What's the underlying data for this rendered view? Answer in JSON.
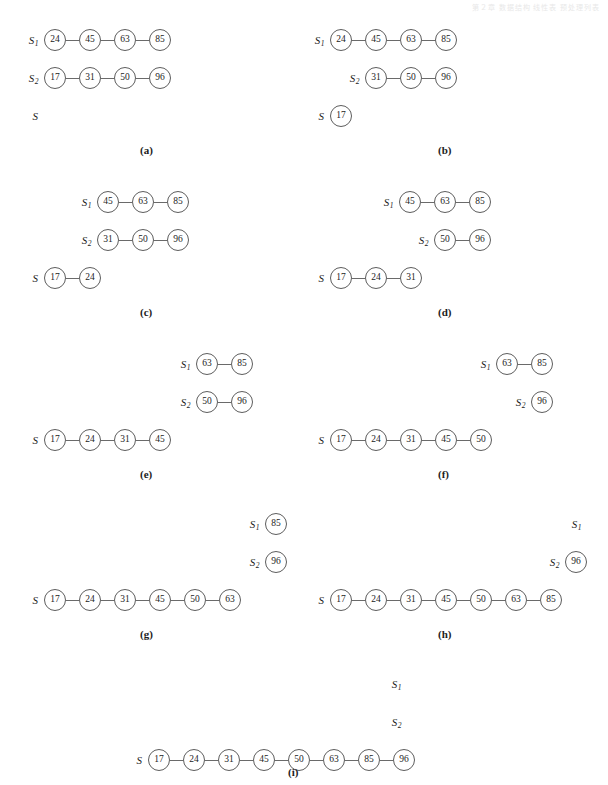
{
  "header": {
    "text": "第２章  数据结构  线性表  预处理列表"
  },
  "labels": {
    "s1": "S",
    "s1_sub": "1",
    "s2": "S",
    "s2_sub": "2",
    "s": "S"
  },
  "panels": [
    {
      "id": "a",
      "caption": "(a)",
      "rows": {
        "s1": [
          24,
          45,
          63,
          85
        ],
        "s2": [
          17,
          31,
          50,
          96
        ],
        "s": []
      }
    },
    {
      "id": "b",
      "caption": "(b)",
      "rows": {
        "s1": [
          24,
          45,
          63,
          85
        ],
        "s2": [
          31,
          50,
          96
        ],
        "s": [
          17
        ]
      }
    },
    {
      "id": "c",
      "caption": "(c)",
      "rows": {
        "s1": [
          45,
          63,
          85
        ],
        "s2": [
          31,
          50,
          96
        ],
        "s": [
          17,
          24
        ]
      }
    },
    {
      "id": "d",
      "caption": "(d)",
      "rows": {
        "s1": [
          45,
          63,
          85
        ],
        "s2": [
          50,
          96
        ],
        "s": [
          17,
          24,
          31
        ]
      }
    },
    {
      "id": "e",
      "caption": "(e)",
      "rows": {
        "s1": [
          63,
          85
        ],
        "s2": [
          50,
          96
        ],
        "s": [
          17,
          24,
          31,
          45
        ]
      }
    },
    {
      "id": "f",
      "caption": "(f)",
      "rows": {
        "s1": [
          63,
          85
        ],
        "s2": [
          96
        ],
        "s": [
          17,
          24,
          31,
          45,
          50
        ]
      }
    },
    {
      "id": "g",
      "caption": "(g)",
      "rows": {
        "s1": [
          85
        ],
        "s2": [
          96
        ],
        "s": [
          17,
          24,
          31,
          45,
          50,
          63
        ]
      }
    },
    {
      "id": "h",
      "caption": "(h)",
      "rows": {
        "s1": [],
        "s2": [
          96
        ],
        "s": [
          17,
          24,
          31,
          45,
          50,
          63,
          85
        ]
      }
    },
    {
      "id": "i",
      "caption": "(i)",
      "rows": {
        "s1": [],
        "s2": [],
        "s": [
          17,
          24,
          31,
          45,
          50,
          63,
          85,
          96
        ]
      }
    }
  ],
  "geometry": {
    "node_diameter": 22,
    "link_length": 13,
    "row_pitch": 38,
    "panel_positions": [
      {
        "id": "a",
        "left": 44,
        "top": 28,
        "caption_left": 140,
        "caption_top": 144
      },
      {
        "id": "b",
        "left": 330,
        "top": 28,
        "caption_left": 438,
        "caption_top": 144
      },
      {
        "id": "c",
        "left": 62,
        "top": 190,
        "caption_left": 140,
        "caption_top": 306
      },
      {
        "id": "d",
        "left": 364,
        "top": 190,
        "caption_left": 438,
        "caption_top": 306
      },
      {
        "id": "e",
        "left": 126,
        "top": 352,
        "caption_left": 140,
        "caption_top": 468
      },
      {
        "id": "f",
        "left": 426,
        "top": 352,
        "caption_left": 438,
        "caption_top": 468
      },
      {
        "id": "g",
        "left": 160,
        "top": 512,
        "caption_left": 140,
        "caption_top": 628
      },
      {
        "id": "h",
        "left": 460,
        "top": 512,
        "caption_left": 438,
        "caption_top": 628
      },
      {
        "id": "i",
        "left": 280,
        "top": 672,
        "caption_left": 288,
        "caption_top": 766
      }
    ],
    "s_row_offsets": [
      {
        "id": "a",
        "s_left": 44
      },
      {
        "id": "b",
        "s_left": 330
      },
      {
        "id": "c",
        "s_left": 44
      },
      {
        "id": "d",
        "s_left": 330
      },
      {
        "id": "e",
        "s_left": 44
      },
      {
        "id": "f",
        "s_left": 330
      },
      {
        "id": "g",
        "s_left": 44
      },
      {
        "id": "h",
        "s_left": 330
      },
      {
        "id": "i",
        "s_left": 148
      }
    ]
  }
}
